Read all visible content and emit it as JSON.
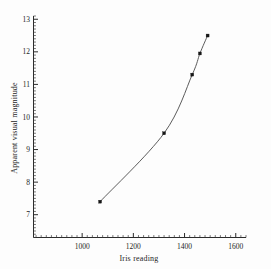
{
  "chart_data": {
    "type": "line",
    "title": "",
    "xlabel": "Iris reading",
    "ylabel": "Apparent visual magnitude",
    "xlim": [
      810,
      1640
    ],
    "ylim": [
      6.3,
      13.1
    ],
    "xticks": [
      1000,
      1200,
      1400,
      1600
    ],
    "xtick_labels": [
      "1000",
      "1200",
      "1400",
      "1600"
    ],
    "yticks": [
      7,
      8,
      9,
      10,
      11,
      12,
      13
    ],
    "ytick_labels": [
      "7",
      "8",
      "9",
      "10",
      "11",
      "12",
      "13"
    ],
    "minor_ticks": true,
    "grid": false,
    "legend": "none",
    "marker": "square",
    "series": [
      {
        "name": "Calibration curve",
        "x": [
          1070,
          1320,
          1430,
          1460,
          1490
        ],
        "y": [
          7.4,
          9.5,
          11.3,
          11.95,
          12.5
        ]
      }
    ]
  },
  "axes": {
    "x_title": "Iris reading",
    "y_title": "Apparent visual magnitude"
  },
  "ticks": {
    "x": [
      "1000",
      "1200",
      "1400",
      "1600"
    ],
    "y": [
      "13",
      "12",
      "11",
      "10",
      "9",
      "8",
      "7"
    ]
  }
}
